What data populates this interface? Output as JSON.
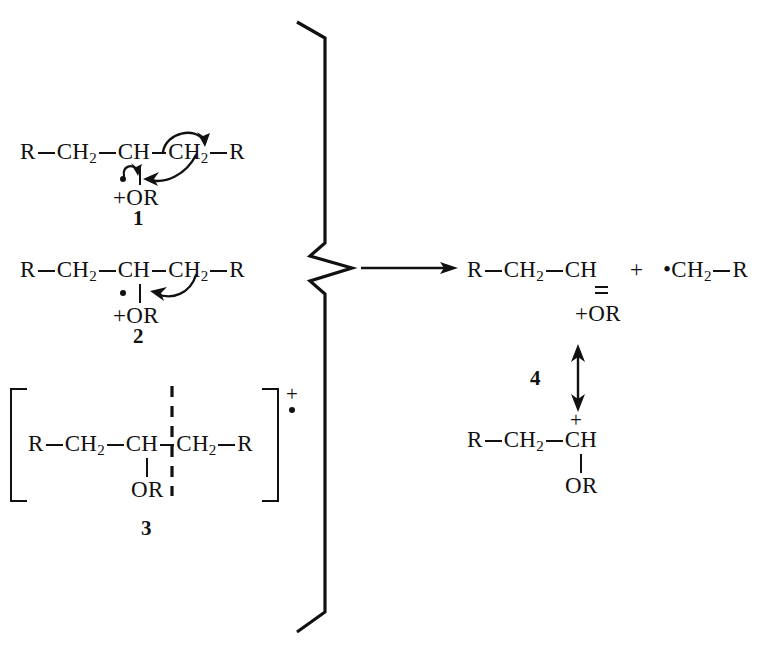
{
  "figure": {
    "kind": "chemical-reaction-scheme",
    "ink_color": "#111111",
    "background_color": "#ffffff"
  },
  "reactants": [
    {
      "id": "1",
      "label": "1",
      "chain": {
        "a": "R",
        "b": "CH",
        "b_sub": "2",
        "c": "CH",
        "d": "CH",
        "d_sub": "2",
        "e": "R"
      },
      "substituent": {
        "charge": "+",
        "group": "OR",
        "radical_dot": true
      },
      "arrows": [
        {
          "name": "bond-homolysis-arrow",
          "from": "CH-CH2 bond",
          "to": "CH2 carbon"
        },
        {
          "name": "radical-attack-arrow",
          "from": "oxygen radical",
          "to": "CH-CH2 bond"
        }
      ]
    },
    {
      "id": "2",
      "label": "2",
      "chain": {
        "a": "R",
        "b": "CH",
        "b_sub": "2",
        "c": "CH",
        "d": "CH",
        "d_sub": "2",
        "e": "R"
      },
      "substituent": {
        "charge": "+",
        "group": "OR",
        "radical_dot": true
      },
      "arrows": [
        {
          "name": "hydride-shift-arrow",
          "from": "CH-CH2 bond",
          "to": "C-O bond"
        }
      ]
    },
    {
      "id": "3",
      "label": "3",
      "bracketed": true,
      "bracket_charge": "+",
      "bracket_radical": "•",
      "chain": {
        "a": "R",
        "b": "CH",
        "b_sub": "2",
        "c": "CH",
        "d": "CH",
        "d_sub": "2",
        "e": "R"
      },
      "substituent": {
        "group": "OR"
      },
      "dashed_bond": true
    }
  ],
  "products": [
    {
      "id": "4",
      "label": "4",
      "resonance_form": "oxocarbenium-upper",
      "chain": {
        "a": "R",
        "b": "CH",
        "b_sub": "2",
        "c": "CH"
      },
      "substituent": {
        "charge": "+",
        "group": "OR",
        "double_bond": true
      }
    },
    {
      "id": "4b",
      "resonance_form": "carbocation-lower",
      "chain": {
        "a": "R",
        "b": "CH",
        "b_sub": "2",
        "c": "CH"
      },
      "charge_on_c": "+",
      "substituent": {
        "group": "OR"
      }
    }
  ],
  "radical_fragment": {
    "radical_dot": "•",
    "a": "CH",
    "a_sub": "2",
    "b": "R"
  },
  "operators": {
    "plus": "+",
    "reaction_arrow": "→",
    "resonance_arrow": "↔"
  },
  "brace": {
    "name": "grouping-brace",
    "orientation": "right-pointing"
  }
}
